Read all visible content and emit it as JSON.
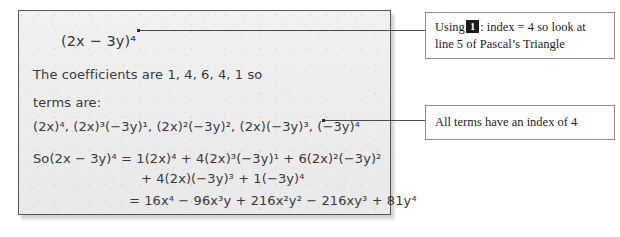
{
  "worksheet": {
    "expression": "(2x − 3y)⁴",
    "coefficients_text": "The coefficients are 1, 4, 6, 4, 1 so",
    "terms_label": "terms are:",
    "terms_text": "(2x)⁴, (2x)³(−3y)¹, (2x)²(−3y)², (2x)(−3y)³, (−3y)⁴",
    "expansion_line_1": "So(2x − 3y)⁴ = 1(2x)⁴ + 4(2x)³(−3y)¹ + 6(2x)²(−3y)²",
    "expansion_line_2": "+ 4(2x)(−3y)³ + 1(−3y)⁴",
    "result_line": "= 16x⁴ − 96x³y + 216x²y² − 216xy³ + 81y⁴",
    "coefficients": [
      1,
      4,
      6,
      4,
      1
    ],
    "index": 4,
    "pascal_line": 5
  },
  "callouts": {
    "pascal": {
      "prefix": "Using",
      "key_label": "1",
      "suffix": ": index = 4 so look at line 5 of Pascal’s Triangle"
    },
    "index": {
      "text": "All terms have an index of 4"
    }
  },
  "colors": {
    "paper": "#eeeeee",
    "panel_border": "#55565a",
    "ink": "#3a3a3c",
    "callout_border": "#8d8d90",
    "callout_text": "#1c1c1e",
    "leader": "#4a4a4d"
  }
}
